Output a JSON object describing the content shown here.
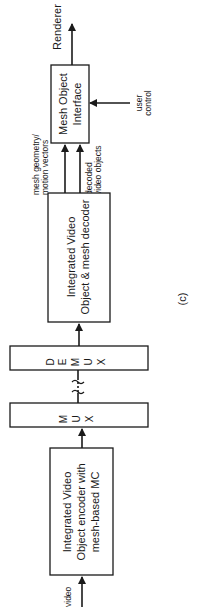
{
  "figure": {
    "caption": "(c)",
    "orientation": "rotated-90-ccw"
  },
  "blocks": {
    "encoder": {
      "lines": [
        "Integrated Video",
        "Object encoder with",
        "mesh-based MC"
      ]
    },
    "mux": {
      "letters": [
        "M",
        "U",
        "X"
      ]
    },
    "demux": {
      "letters": [
        "D",
        "E",
        "M",
        "U",
        "X"
      ]
    },
    "decoder": {
      "lines": [
        "Integrated Video",
        "Object & mesh decoder"
      ]
    },
    "interface": {
      "lines": [
        "Mesh Object",
        "Interface"
      ]
    }
  },
  "signals": {
    "input": "video",
    "output": "Renderer",
    "user_control": [
      "user",
      "control"
    ],
    "mesh_geometry": [
      "mesh geometry/",
      "motion vectors"
    ],
    "decoded_objects": [
      "decoded",
      "video objects"
    ]
  }
}
